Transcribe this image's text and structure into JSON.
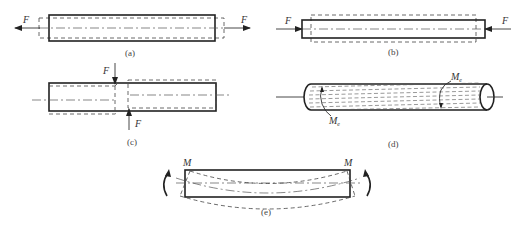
{
  "figure": {
    "panels": [
      {
        "id": "a",
        "caption": "(a)",
        "description": "axial tension",
        "force_labels": [
          "F",
          "F"
        ]
      },
      {
        "id": "b",
        "caption": "(b)",
        "description": "axial compression",
        "force_labels": [
          "F",
          "F"
        ]
      },
      {
        "id": "c",
        "caption": "(c)",
        "description": "shear",
        "force_labels": [
          "F",
          "F"
        ]
      },
      {
        "id": "d",
        "caption": "(d)",
        "description": "torsion",
        "moment_labels": [
          "M",
          "M"
        ],
        "moment_subscript": "e"
      },
      {
        "id": "e",
        "caption": "(e)",
        "description": "bending",
        "moment_labels": [
          "M",
          "M"
        ]
      }
    ]
  }
}
